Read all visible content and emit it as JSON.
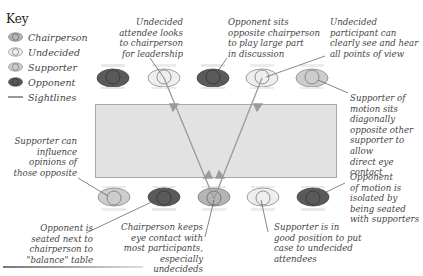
{
  "key": {
    "title": "Key",
    "items": [
      {
        "label": "Chairperson",
        "role": "chairperson"
      },
      {
        "label": "Undecided",
        "role": "undecided"
      },
      {
        "label": "Supporter",
        "role": "supporter"
      },
      {
        "label": "Opponent",
        "role": "opponent"
      },
      {
        "label": "Sightlines",
        "role": "sightline"
      }
    ]
  },
  "colors": {
    "chairperson": "#b5b5b5",
    "undecided": "#e6e6e6",
    "supporter": "#cdcdcd",
    "opponent": "#5a5a5a",
    "table": "#e2e2e2",
    "sightline": "#9a9a9a"
  },
  "seats": {
    "top": [
      {
        "role": "opponent",
        "x": 113
      },
      {
        "role": "undecided",
        "x": 164
      },
      {
        "role": "opponent",
        "x": 213
      },
      {
        "role": "undecided",
        "x": 262
      },
      {
        "role": "supporter",
        "x": 312
      }
    ],
    "bottom": [
      {
        "role": "supporter",
        "x": 114
      },
      {
        "role": "opponent",
        "x": 164
      },
      {
        "role": "chairperson",
        "x": 214
      },
      {
        "role": "undecided",
        "x": 263
      },
      {
        "role": "opponent",
        "x": 313
      }
    ]
  },
  "annotations": {
    "undecided_looks": "Undecided\nattendee looks\nto chairperson\nfor leadership",
    "opponent_opposite": "Opponent sits\nopposite chairperson\nto play large part\nin discussion",
    "undecided_see": "Undecided\nparticipant can\nclearly see and hear\nall points of view",
    "supporter_diagonal": "Supporter of\nmotion sits\ndiagonally\nopposite other\nsupporter to allow\ndirect eye contact",
    "supporter_influence": "Supporter can\ninfluence\nopinions of\nthose opposite",
    "opponent_balance": "Opponent is\nseated next to\nchairperson to\n\"balance\" table",
    "chair_eye_contact": "Chairperson keeps\neye contact with\nmost participants,\nespecially undecideds",
    "supporter_position": "Supporter is in\ngood position to put\ncase to undecided\nattendees",
    "opponent_isolated": "Opponent\nof motion is\nisolated by\nbeing seated\nwith supporters"
  }
}
